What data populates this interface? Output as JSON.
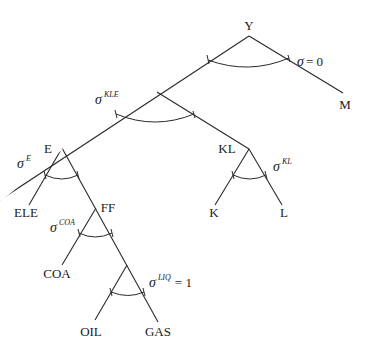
{
  "diagram": {
    "type": "nested CES production tree",
    "nodes": {
      "Y": "Y",
      "M": "M",
      "E": "E",
      "KL": "KL",
      "ELE": "ELE",
      "FF": "FF",
      "K": "K",
      "L": "L",
      "COA": "COA",
      "OIL": "OIL",
      "GAS": "GAS"
    },
    "elasticities": {
      "top": {
        "symbol": "σ",
        "superscript": "",
        "suffix": "= 0"
      },
      "kle": {
        "symbol": "σ",
        "superscript": "KLE",
        "suffix": ""
      },
      "e": {
        "symbol": "σ",
        "superscript": "E",
        "suffix": ""
      },
      "kl": {
        "symbol": "σ",
        "superscript": "KL",
        "suffix": ""
      },
      "coa": {
        "symbol": "σ",
        "superscript": "COA",
        "suffix": ""
      },
      "liq": {
        "symbol": "σ",
        "superscript": "LIQ",
        "suffix": "= 1"
      }
    },
    "edges": [
      [
        "Y",
        "KLE"
      ],
      [
        "Y",
        "M"
      ],
      [
        "KLE",
        "E"
      ],
      [
        "KLE",
        "KL"
      ],
      [
        "E",
        "ELE"
      ],
      [
        "E",
        "FF"
      ],
      [
        "KL",
        "K"
      ],
      [
        "KL",
        "L"
      ],
      [
        "FF",
        "COA"
      ],
      [
        "FF",
        "LIQ"
      ],
      [
        "LIQ",
        "OIL"
      ],
      [
        "LIQ",
        "GAS"
      ]
    ]
  }
}
